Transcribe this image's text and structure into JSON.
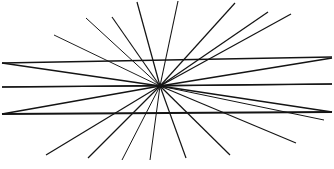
{
  "figure": {
    "type": "line-illusion",
    "canvas": {
      "width": 334,
      "height": 169
    },
    "background_color": "#ffffff",
    "line_color": "#141414",
    "center": {
      "x": 160,
      "y": 86
    },
    "center_label": "convergence point",
    "rays": [
      {
        "name": "ray-1",
        "x1": 160,
        "y1": 86,
        "x2": 137,
        "y2": 2,
        "width": 1.25
      },
      {
        "name": "ray-2",
        "x1": 160,
        "y1": 86,
        "x2": 178,
        "y2": 1,
        "width": 1.1
      },
      {
        "name": "ray-3",
        "x1": 160,
        "y1": 86,
        "x2": 235,
        "y2": 3,
        "width": 1.2
      },
      {
        "name": "ray-4",
        "x1": 160,
        "y1": 86,
        "x2": 112,
        "y2": 17,
        "width": 1.15
      },
      {
        "name": "ray-5",
        "x1": 160,
        "y1": 86,
        "x2": 86,
        "y2": 18,
        "width": 1.0
      },
      {
        "name": "ray-6",
        "x1": 160,
        "y1": 86,
        "x2": 268,
        "y2": 12,
        "width": 1.3
      },
      {
        "name": "ray-7",
        "x1": 160,
        "y1": 86,
        "x2": 291,
        "y2": 14,
        "width": 1.25
      },
      {
        "name": "ray-8",
        "x1": 160,
        "y1": 86,
        "x2": 54,
        "y2": 35,
        "width": 0.95
      },
      {
        "name": "ray-9",
        "x1": 160,
        "y1": 86,
        "x2": 332,
        "y2": 58,
        "width": 1.5
      },
      {
        "name": "ray-10",
        "x1": 160,
        "y1": 86,
        "x2": 2,
        "y2": 63,
        "width": 1.5
      },
      {
        "name": "ray-11",
        "x1": 160,
        "y1": 86,
        "x2": 332,
        "y2": 84,
        "width": 1.0
      },
      {
        "name": "ray-12",
        "x1": 160,
        "y1": 86,
        "x2": 2,
        "y2": 87,
        "width": 1.0
      },
      {
        "name": "ray-13",
        "x1": 160,
        "y1": 86,
        "x2": 332,
        "y2": 112,
        "width": 1.6
      },
      {
        "name": "ray-14",
        "x1": 160,
        "y1": 86,
        "x2": 2,
        "y2": 114,
        "width": 1.6
      },
      {
        "name": "ray-15",
        "x1": 160,
        "y1": 86,
        "x2": 46,
        "y2": 155,
        "width": 1.25
      },
      {
        "name": "ray-16",
        "x1": 160,
        "y1": 86,
        "x2": 296,
        "y2": 143,
        "width": 1.1
      },
      {
        "name": "ray-17",
        "x1": 160,
        "y1": 86,
        "x2": 88,
        "y2": 158,
        "width": 1.2
      },
      {
        "name": "ray-18",
        "x1": 160,
        "y1": 86,
        "x2": 230,
        "y2": 155,
        "width": 1.25
      },
      {
        "name": "ray-19",
        "x1": 160,
        "y1": 86,
        "x2": 122,
        "y2": 160,
        "width": 1.0
      },
      {
        "name": "ray-20",
        "x1": 160,
        "y1": 86,
        "x2": 186,
        "y2": 158,
        "width": 1.2
      },
      {
        "name": "ray-21",
        "x1": 160,
        "y1": 86,
        "x2": 150,
        "y2": 160,
        "width": 1.0
      },
      {
        "name": "ray-22",
        "x1": 160,
        "y1": 86,
        "x2": 324,
        "y2": 120,
        "width": 1.0
      }
    ],
    "transversals": [
      {
        "name": "transversal-upper",
        "x1": 2,
        "y1": 63,
        "x2": 332,
        "y2": 57,
        "width": 1.7
      },
      {
        "name": "transversal-middle",
        "x1": 2,
        "y1": 87,
        "x2": 332,
        "y2": 84,
        "width": 1.3
      },
      {
        "name": "transversal-lower",
        "x1": 2,
        "y1": 114,
        "x2": 332,
        "y2": 112,
        "width": 1.9
      }
    ],
    "ray_count_label": "22",
    "transversal_count_label": "3"
  }
}
